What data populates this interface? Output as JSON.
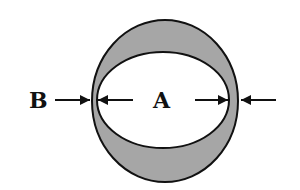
{
  "diagram": {
    "labels": {
      "outer": "B",
      "inner": "A"
    },
    "colors": {
      "ring_fill": "#a6a6a6",
      "stroke": "#111111",
      "background": "#ffffff",
      "inner_fill": "#ffffff"
    }
  }
}
